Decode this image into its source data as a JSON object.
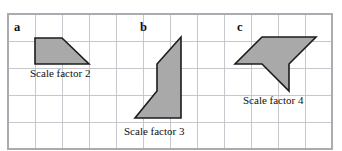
{
  "figure": {
    "background_color": "#ffffff",
    "grid": {
      "line_color": "#bfc2c7",
      "border_color": "#a9acb1",
      "cell_size": 27,
      "columns": 12,
      "rows": 5,
      "x0": 8,
      "y0": 14,
      "x1": 332,
      "y1": 149
    },
    "shape_fill_color": "#a9a9a9",
    "shape_stroke_color": "#1c1c1c",
    "items": [
      {
        "letter": "a",
        "letter_x": 14,
        "letter_y": 31,
        "scale_label": "Scale factor 2",
        "scale_label_x": 30,
        "scale_label_y": 77,
        "shape_type": "trapezoid",
        "points": "35,38 62,38 89,64 35,64"
      },
      {
        "letter": "b",
        "letter_x": 140,
        "letter_y": 31,
        "scale_label": "Scale factor 3",
        "scale_label_x": 124,
        "scale_label_y": 135,
        "shape_type": "pentagon",
        "points": "181,37 181,118 135,118 157,91 157,64"
      },
      {
        "letter": "c",
        "letter_x": 237,
        "letter_y": 31,
        "scale_label": "Scale factor 4",
        "scale_label_x": 243,
        "scale_label_y": 104,
        "shape_type": "concave-arrow",
        "points": "262,37 316,37 289,64 289,91 262,64 235,64"
      }
    ],
    "grid_vertical_x": [
      8,
      35,
      62,
      89,
      116,
      143,
      170,
      197,
      224,
      251,
      278,
      305,
      332
    ],
    "grid_horizontal_y": [
      14,
      41,
      68,
      95,
      122,
      149
    ]
  }
}
